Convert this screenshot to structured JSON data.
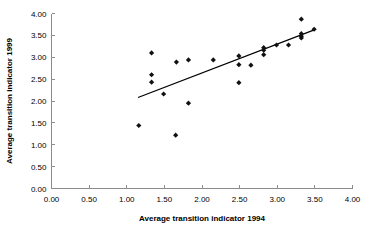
{
  "chart_data": {
    "type": "scatter",
    "title": "",
    "subtitle": "",
    "xlabel": "Average transition indicator 1994",
    "ylabel": "Average transition indicator 1999",
    "xlim": [
      0.0,
      4.0
    ],
    "ylim": [
      0.0,
      4.0
    ],
    "xticks": [
      "0.00",
      "0.50",
      "1.00",
      "1.50",
      "2.00",
      "2.50",
      "3.00",
      "3.50",
      "4.00"
    ],
    "yticks": [
      "0.00",
      "0.50",
      "1.00",
      "1.50",
      "2.00",
      "2.50",
      "3.00",
      "3.50",
      "4.00"
    ],
    "xtick_values": [
      0.0,
      0.5,
      1.0,
      1.5,
      2.0,
      2.5,
      3.0,
      3.5,
      4.0
    ],
    "ytick_values": [
      0.0,
      0.5,
      1.0,
      1.5,
      2.0,
      2.5,
      3.0,
      3.5,
      4.0
    ],
    "grid": false,
    "legend": false,
    "legend_position": "none",
    "marker_shape": "diamond",
    "marker_color": "#111111",
    "axis_color": "#8c8c8c",
    "background_color": "#ffffff",
    "points": [
      {
        "x": 1.16,
        "y": 1.44
      },
      {
        "x": 1.33,
        "y": 3.1
      },
      {
        "x": 1.33,
        "y": 2.6
      },
      {
        "x": 1.33,
        "y": 2.43
      },
      {
        "x": 1.49,
        "y": 2.16
      },
      {
        "x": 1.65,
        "y": 1.22
      },
      {
        "x": 1.66,
        "y": 2.89
      },
      {
        "x": 1.82,
        "y": 2.94
      },
      {
        "x": 1.82,
        "y": 1.95
      },
      {
        "x": 2.15,
        "y": 2.94
      },
      {
        "x": 2.49,
        "y": 3.03
      },
      {
        "x": 2.49,
        "y": 2.83
      },
      {
        "x": 2.49,
        "y": 2.42
      },
      {
        "x": 2.65,
        "y": 2.82
      },
      {
        "x": 2.82,
        "y": 3.22
      },
      {
        "x": 2.82,
        "y": 3.16
      },
      {
        "x": 2.82,
        "y": 3.06
      },
      {
        "x": 2.99,
        "y": 3.28
      },
      {
        "x": 3.15,
        "y": 3.28
      },
      {
        "x": 3.32,
        "y": 3.87
      },
      {
        "x": 3.32,
        "y": 3.54
      },
      {
        "x": 3.32,
        "y": 3.48
      },
      {
        "x": 3.32,
        "y": 3.44
      },
      {
        "x": 3.49,
        "y": 3.64
      }
    ],
    "trend_line": {
      "visible": true,
      "x_start": 1.15,
      "y_start": 2.08,
      "x_end": 3.5,
      "y_end": 3.63
    }
  }
}
